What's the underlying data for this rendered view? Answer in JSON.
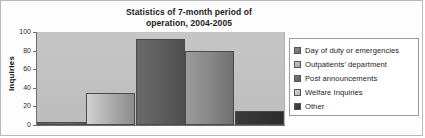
{
  "chart_data": {
    "type": "bar",
    "title": "Statistics of 7-month period of operation, 2004-2005",
    "title_lines": [
      "Statistics of 7-month period of",
      "operation, 2004-2005"
    ],
    "xlabel": "",
    "ylabel": "Inquiries",
    "ylim": [
      0,
      100
    ],
    "yticks": [
      100,
      80,
      60,
      40,
      20,
      0
    ],
    "grid": false,
    "legend_position": "right",
    "categories": [
      "Day of duty or emergencies",
      "Outpatients' department",
      "Post announcements",
      "Welfare Inquiries",
      "Other"
    ],
    "values": [
      3,
      34,
      92,
      80,
      15
    ],
    "colors": [
      "#6e6e6e",
      "#a8a8a8",
      "#5f5f5f",
      "#888888",
      "#333333"
    ],
    "plot_background": "#c3c3c3"
  },
  "legend": {
    "items": [
      {
        "label": "Day of duty or emergencies"
      },
      {
        "label": "Outpatients' department"
      },
      {
        "label": "Post announcements"
      },
      {
        "label": "Welfare Inquiries"
      },
      {
        "label": "Other"
      }
    ]
  }
}
